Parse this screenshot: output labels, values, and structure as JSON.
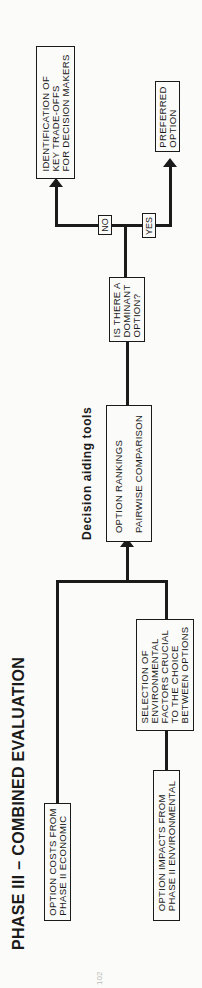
{
  "title": "PHASE III – COMBINED EVALUATION",
  "subtitle": "Decision aiding tools",
  "boxes": {
    "option_costs": "OPTION COSTS FROM\nPHASE II ECONOMIC",
    "option_impacts": "OPTION IMPACTS FROM\nPHASE II ENVIRONMENTAL",
    "selection": "SELECTION OF\nENVIRONMENTAL\nFACTORS CRUCIAL\nTO THE CHOICE\nBETWEEN OPTIONS",
    "tools": "OPTION RANKINGS\n\nPAIRWISE COMPARISON",
    "question": "IS THERE A\nDOMINANT\nOPTION?",
    "tradeoffs": "IDENTIFICATION OF\nKEY TRADE-OFFS\nFOR DECISION MAKERS",
    "preferred": "PREFERRED\nOPTION"
  },
  "labels": {
    "no": "NO",
    "yes": "YES"
  },
  "page_number": "102"
}
